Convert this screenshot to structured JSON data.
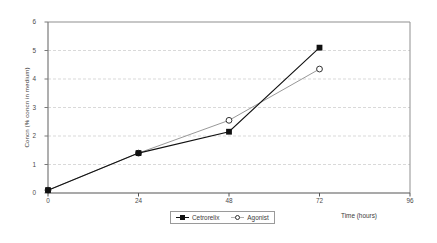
{
  "chart_data": {
    "type": "line",
    "title": "",
    "xlabel": "Time (hours)",
    "ylabel": "Concn (% concn in medium)",
    "x": [
      0,
      24,
      48,
      72
    ],
    "xlim": [
      0,
      96
    ],
    "ylim": [
      0,
      6
    ],
    "xticks": [
      "0",
      "24",
      "48",
      "72",
      "96"
    ],
    "yticks": [
      "0",
      "1",
      "2",
      "3",
      "4",
      "5",
      "6"
    ],
    "grid": "horizontal-dashed",
    "legend_position": "bottom-center",
    "series": [
      {
        "name": "Cetrorelix",
        "values": [
          0.1,
          1.4,
          2.15,
          5.1
        ],
        "marker": "filled-square",
        "color": "#111111"
      },
      {
        "name": "Agonist",
        "values": [
          0.1,
          1.4,
          2.55,
          4.35
        ],
        "marker": "open-circle",
        "color": "#8c8c8c"
      }
    ]
  },
  "axes": {
    "y_title": "Concn (% concn in medium)",
    "x_title": "Time (hours)",
    "y_tick_labels": [
      "6",
      "5",
      "4",
      "3",
      "2",
      "1",
      "0"
    ],
    "x_tick_labels": [
      "0",
      "24",
      "48",
      "72",
      "96"
    ]
  },
  "legend": {
    "items": [
      {
        "label": "Cetrorelix",
        "marker": "filled-square-icon"
      },
      {
        "label": "Agonist",
        "marker": "open-circle-icon"
      }
    ]
  },
  "colors": {
    "series_cetrorelix": "#111111",
    "series_agonist": "#8c8c8c",
    "gridline": "#cfcfcf",
    "frame": "#808080",
    "background": "#ffffff",
    "text": "#3b3b3b"
  }
}
